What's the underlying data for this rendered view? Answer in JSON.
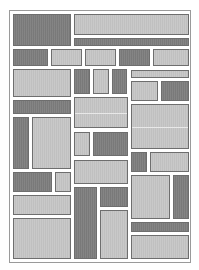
{
  "figure": {
    "colors": {
      "dark": "#7d7d7d",
      "light": "#c6c6c6",
      "border": "#6e6e6e",
      "frame": "#9a9a9a",
      "background": "#ffffff"
    },
    "blocks": [
      {
        "id": 1,
        "tone": "dark",
        "x": 13,
        "y": 14,
        "w": 58,
        "h": 32
      },
      {
        "id": 2,
        "tone": "light",
        "x": 74,
        "y": 14,
        "w": 115,
        "h": 21
      },
      {
        "id": 3,
        "tone": "dark",
        "x": 74,
        "y": 38,
        "w": 115,
        "h": 8
      },
      {
        "id": 4,
        "tone": "dark",
        "x": 13,
        "y": 49,
        "w": 35,
        "h": 17
      },
      {
        "id": 5,
        "tone": "light",
        "x": 51,
        "y": 49,
        "w": 31,
        "h": 17
      },
      {
        "id": 6,
        "tone": "light",
        "x": 85,
        "y": 49,
        "w": 31,
        "h": 17
      },
      {
        "id": 7,
        "tone": "dark",
        "x": 119,
        "y": 49,
        "w": 31,
        "h": 17
      },
      {
        "id": 8,
        "tone": "light",
        "x": 153,
        "y": 49,
        "w": 36,
        "h": 17
      },
      {
        "id": 9,
        "tone": "light",
        "x": 13,
        "y": 69,
        "w": 58,
        "h": 28
      },
      {
        "id": 10,
        "tone": "dark",
        "x": 74,
        "y": 69,
        "w": 16,
        "h": 25
      },
      {
        "id": 11,
        "tone": "light",
        "x": 93,
        "y": 69,
        "w": 16,
        "h": 25
      },
      {
        "id": 12,
        "tone": "dark",
        "x": 112,
        "y": 69,
        "w": 15,
        "h": 25
      },
      {
        "id": 13,
        "tone": "light",
        "x": 131,
        "y": 70,
        "w": 58,
        "h": 8
      },
      {
        "id": 14,
        "tone": "light",
        "x": 131,
        "y": 81,
        "w": 27,
        "h": 20
      },
      {
        "id": 15,
        "tone": "dark",
        "x": 161,
        "y": 81,
        "w": 28,
        "h": 20
      },
      {
        "id": 16,
        "tone": "dark",
        "x": 13,
        "y": 100,
        "w": 58,
        "h": 14
      },
      {
        "id": 17,
        "tone": "light",
        "x": 74,
        "y": 97,
        "w": 54,
        "h": 31,
        "split": true
      },
      {
        "id": 18,
        "tone": "light",
        "x": 131,
        "y": 104,
        "w": 58,
        "h": 45,
        "split": true
      },
      {
        "id": 19,
        "tone": "dark",
        "x": 13,
        "y": 117,
        "w": 16,
        "h": 52
      },
      {
        "id": 20,
        "tone": "light",
        "x": 32,
        "y": 117,
        "w": 39,
        "h": 52
      },
      {
        "id": 21,
        "tone": "light",
        "x": 74,
        "y": 132,
        "w": 16,
        "h": 24
      },
      {
        "id": 22,
        "tone": "dark",
        "x": 93,
        "y": 132,
        "w": 35,
        "h": 24
      },
      {
        "id": 23,
        "tone": "dark",
        "x": 131,
        "y": 152,
        "w": 16,
        "h": 20
      },
      {
        "id": 24,
        "tone": "light",
        "x": 150,
        "y": 152,
        "w": 39,
        "h": 20
      },
      {
        "id": 25,
        "tone": "light",
        "x": 74,
        "y": 160,
        "w": 54,
        "h": 24
      },
      {
        "id": 26,
        "tone": "dark",
        "x": 13,
        "y": 172,
        "w": 39,
        "h": 20
      },
      {
        "id": 27,
        "tone": "light",
        "x": 55,
        "y": 172,
        "w": 16,
        "h": 20
      },
      {
        "id": 28,
        "tone": "light",
        "x": 131,
        "y": 175,
        "w": 39,
        "h": 44
      },
      {
        "id": 29,
        "tone": "dark",
        "x": 173,
        "y": 175,
        "w": 16,
        "h": 44
      },
      {
        "id": 30,
        "tone": "dark",
        "x": 74,
        "y": 187,
        "w": 23,
        "h": 72
      },
      {
        "id": 31,
        "tone": "dark",
        "x": 100,
        "y": 187,
        "w": 28,
        "h": 20
      },
      {
        "id": 32,
        "tone": "light",
        "x": 13,
        "y": 195,
        "w": 58,
        "h": 20
      },
      {
        "id": 33,
        "tone": "light",
        "x": 100,
        "y": 210,
        "w": 28,
        "h": 49
      },
      {
        "id": 34,
        "tone": "light",
        "x": 13,
        "y": 218,
        "w": 58,
        "h": 41
      },
      {
        "id": 35,
        "tone": "dark",
        "x": 131,
        "y": 222,
        "w": 58,
        "h": 10
      },
      {
        "id": 36,
        "tone": "light",
        "x": 131,
        "y": 235,
        "w": 58,
        "h": 24
      }
    ]
  }
}
